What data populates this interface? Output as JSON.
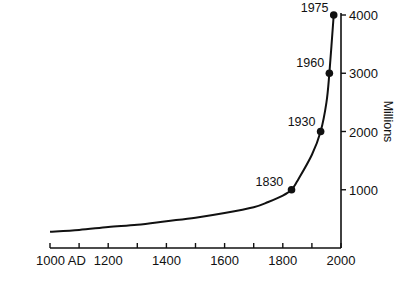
{
  "chart_data": {
    "type": "line",
    "title": "",
    "xlabel": "",
    "ylabel": "Millions",
    "xlim": [
      1000,
      2000
    ],
    "ylim": [
      0,
      4000
    ],
    "grid": false,
    "legend": "none",
    "x_tick_labels": [
      "1000 AD",
      "1200",
      "1400",
      "1600",
      "1800",
      "2000"
    ],
    "x_ticks": [
      1000,
      1100,
      1200,
      1300,
      1400,
      1500,
      1600,
      1700,
      1800,
      1900,
      2000
    ],
    "y_tick_labels": [
      "1000",
      "2000",
      "3000",
      "4000"
    ],
    "y_ticks": [
      1000,
      2000,
      3000,
      4000
    ],
    "series": [
      {
        "name": "World population",
        "x": [
          1000,
          1100,
          1200,
          1300,
          1400,
          1500,
          1600,
          1700,
          1750,
          1800,
          1830,
          1850,
          1900,
          1930,
          1950,
          1960,
          1975
        ],
        "values": [
          280,
          310,
          360,
          400,
          460,
          520,
          600,
          700,
          790,
          900,
          1000,
          1150,
          1600,
          2000,
          2500,
          3000,
          4000
        ]
      }
    ],
    "annotations": [
      {
        "label": "1830",
        "x": 1830,
        "y": 1000
      },
      {
        "label": "1930",
        "x": 1930,
        "y": 2000
      },
      {
        "label": "1960",
        "x": 1960,
        "y": 3000
      },
      {
        "label": "1975",
        "x": 1975,
        "y": 4000
      }
    ]
  }
}
